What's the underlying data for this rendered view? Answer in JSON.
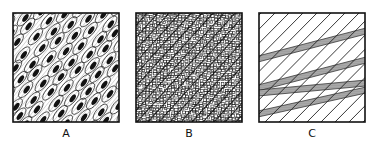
{
  "figure": {
    "panels": [
      {
        "label": "A",
        "texture": "elongated-cells-with-dark-inclusions",
        "orientation": "diagonal"
      },
      {
        "label": "B",
        "texture": "fine-granular-mosaic",
        "orientation": "diagonal"
      },
      {
        "label": "C",
        "texture": "parallel-diagonal-lines-with-shaded-bands",
        "orientation": "diagonal"
      }
    ]
  }
}
